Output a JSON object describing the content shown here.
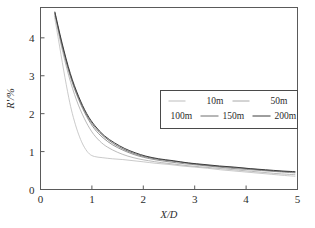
{
  "chart_data": {
    "type": "line",
    "title": "",
    "xlabel": "X/D",
    "ylabel": "R'/%",
    "xlim": [
      0,
      5
    ],
    "ylim": [
      0,
      4.8
    ],
    "xticks": [
      "0",
      "1",
      "2",
      "3",
      "4",
      "5"
    ],
    "xtick_values": [
      0,
      1,
      2,
      3,
      4,
      5
    ],
    "yticks": [
      "0",
      "1",
      "2",
      "3",
      "4"
    ],
    "ytick_values": [
      0,
      1,
      2,
      3,
      4
    ],
    "grid": false,
    "legend_position": "center-right",
    "series": [
      {
        "name": "10m",
        "color": "#bdbdbd",
        "width": 0.8,
        "x": [
          0.27,
          0.35,
          0.45,
          0.55,
          0.62,
          0.7,
          0.78,
          0.86,
          0.95,
          1.05,
          1.2,
          1.4,
          1.6,
          1.8,
          2.0,
          2.25,
          2.5,
          2.75,
          3.0,
          3.25,
          3.5,
          3.75,
          4.0,
          4.25,
          4.5,
          4.75,
          4.95
        ],
        "y": [
          4.58,
          3.95,
          3.15,
          2.42,
          2.0,
          1.62,
          1.32,
          1.1,
          0.94,
          0.87,
          0.84,
          0.81,
          0.79,
          0.76,
          0.73,
          0.69,
          0.66,
          0.62,
          0.59,
          0.56,
          0.52,
          0.49,
          0.46,
          0.43,
          0.4,
          0.37,
          0.35
        ]
      },
      {
        "name": "50m",
        "color": "#a8a8a8",
        "width": 0.8,
        "x": [
          0.28,
          0.4,
          0.55,
          0.7,
          0.85,
          1.0,
          1.15,
          1.3,
          1.5,
          1.7,
          1.9,
          2.1,
          2.35,
          2.6,
          2.85,
          3.1,
          3.35,
          3.6,
          3.85,
          4.1,
          4.35,
          4.6,
          4.95
        ],
        "y": [
          4.62,
          3.82,
          3.0,
          2.36,
          1.88,
          1.52,
          1.28,
          1.12,
          0.98,
          0.88,
          0.81,
          0.76,
          0.71,
          0.67,
          0.63,
          0.6,
          0.57,
          0.54,
          0.51,
          0.48,
          0.45,
          0.42,
          0.39
        ]
      },
      {
        "name": "100m",
        "color": "#8a8a8a",
        "width": 0.9,
        "x": [
          0.28,
          0.42,
          0.58,
          0.74,
          0.9,
          1.05,
          1.22,
          1.4,
          1.6,
          1.8,
          2.0,
          2.25,
          2.5,
          2.8,
          3.1,
          3.4,
          3.7,
          4.0,
          4.3,
          4.6,
          4.95
        ],
        "y": [
          4.64,
          3.78,
          2.98,
          2.38,
          1.92,
          1.6,
          1.36,
          1.18,
          1.04,
          0.93,
          0.85,
          0.78,
          0.73,
          0.68,
          0.64,
          0.6,
          0.56,
          0.53,
          0.5,
          0.47,
          0.44
        ]
      },
      {
        "name": "150m",
        "color": "#6e6e6e",
        "width": 0.9,
        "x": [
          0.28,
          0.42,
          0.58,
          0.74,
          0.9,
          1.06,
          1.24,
          1.42,
          1.62,
          1.82,
          2.02,
          2.28,
          2.55,
          2.85,
          3.15,
          3.45,
          3.75,
          4.05,
          4.35,
          4.65,
          4.95
        ],
        "y": [
          4.66,
          3.82,
          3.02,
          2.42,
          1.96,
          1.64,
          1.39,
          1.21,
          1.06,
          0.95,
          0.87,
          0.8,
          0.75,
          0.7,
          0.65,
          0.61,
          0.58,
          0.55,
          0.51,
          0.48,
          0.46
        ]
      },
      {
        "name": "200m",
        "color": "#3d3d3d",
        "width": 1.0,
        "x": [
          0.28,
          0.42,
          0.58,
          0.74,
          0.9,
          1.06,
          1.24,
          1.44,
          1.64,
          1.84,
          2.05,
          2.3,
          2.58,
          2.88,
          3.18,
          3.48,
          3.78,
          4.08,
          4.38,
          4.68,
          4.95
        ],
        "y": [
          4.68,
          3.86,
          3.06,
          2.46,
          2.0,
          1.68,
          1.42,
          1.23,
          1.08,
          0.97,
          0.88,
          0.81,
          0.76,
          0.7,
          0.66,
          0.62,
          0.59,
          0.55,
          0.52,
          0.49,
          0.47
        ]
      }
    ]
  },
  "legend": {
    "rows": [
      [
        {
          "label": "10m",
          "color": "#bdbdbd"
        },
        {
          "label": "50m",
          "color": "#a8a8a8"
        }
      ],
      [
        {
          "label": "100m",
          "color": "#8a8a8a"
        },
        {
          "label": "150m",
          "color": "#6e6e6e"
        },
        {
          "label": "200m",
          "color": "#3d3d3d"
        }
      ]
    ]
  },
  "axes": {
    "x_label": "X/D",
    "y_label": "R'/%"
  }
}
